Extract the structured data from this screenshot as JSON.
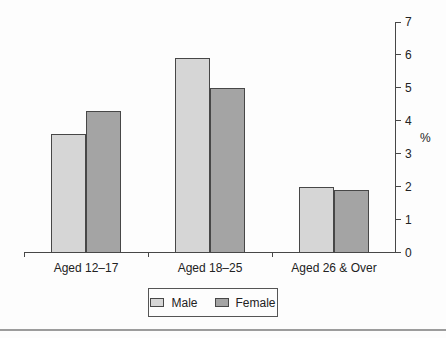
{
  "figure": {
    "background": "#fdfdfd",
    "axis_color": "#474747",
    "text_color": "#222222",
    "bottom_rule_color": "#9c9c9c"
  },
  "chart_data": {
    "type": "bar",
    "title": "",
    "xlabel": "",
    "ylabel": "%",
    "categories": [
      "Aged 12–17",
      "Aged 18–25",
      "Aged 26 & Over"
    ],
    "series": [
      {
        "name": "Male",
        "values": [
          3.6,
          5.9,
          2.0
        ],
        "color": "#d6d6d6"
      },
      {
        "name": "Female",
        "values": [
          4.3,
          5.0,
          1.9
        ],
        "color": "#a4a4a4"
      }
    ],
    "ylim": [
      0,
      7
    ],
    "yticks": [
      0,
      1,
      2,
      3,
      4,
      5,
      6,
      7
    ],
    "y_axis_side": "right",
    "grid": false,
    "legend_position": "bottom-center"
  }
}
